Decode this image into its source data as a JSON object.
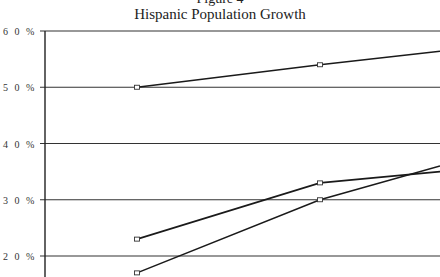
{
  "chart_data": {
    "type": "line",
    "figure_label": "Figure 4",
    "title": "Hispanic Population Growth",
    "xlabel": "",
    "ylabel": "",
    "ylim": [
      16,
      60
    ],
    "yticks": [
      20,
      30,
      40,
      50,
      60
    ],
    "ytick_labels": [
      "2 0 %",
      "3 0 %",
      "4 0 %",
      "5 0 %",
      "6 0 %"
    ],
    "grid": true,
    "x": [
      1,
      2,
      3
    ],
    "series": [
      {
        "name": "Series 1",
        "values": [
          50,
          54,
          56.4
        ]
      },
      {
        "name": "Series 2",
        "values": [
          23,
          33,
          35
        ]
      },
      {
        "name": "Series 3",
        "values": [
          17,
          30,
          36
        ]
      }
    ]
  }
}
